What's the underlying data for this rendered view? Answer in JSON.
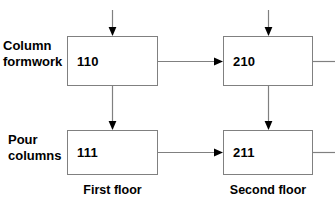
{
  "diagram": {
    "line_color": "#808080",
    "arrow_color": "#000000",
    "text_color": "#000000",
    "background": "#ffffff"
  },
  "row_labels": [
    {
      "line1": "Column",
      "line2": "formwork"
    },
    {
      "line1": "Pour",
      "line2": "columns"
    }
  ],
  "column_labels": [
    {
      "text": "First floor"
    },
    {
      "text": "Second floor"
    }
  ],
  "nodes": [
    {
      "id": "110",
      "label": "110"
    },
    {
      "id": "210",
      "label": "210"
    },
    {
      "id": "111",
      "label": "111"
    },
    {
      "id": "211",
      "label": "211"
    }
  ],
  "connections": [
    {
      "from": "input-top-left",
      "to": "110",
      "kind": "arrow-down"
    },
    {
      "from": "input-top-right",
      "to": "210",
      "kind": "arrow-down"
    },
    {
      "from": "110",
      "to": "210",
      "kind": "arrow-right"
    },
    {
      "from": "110",
      "to": "111",
      "kind": "arrow-down"
    },
    {
      "from": "210",
      "to": "211",
      "kind": "arrow-down"
    },
    {
      "from": "111",
      "to": "211",
      "kind": "arrow-right"
    },
    {
      "from": "210",
      "to": "output-right-top",
      "kind": "line-right"
    },
    {
      "from": "211",
      "to": "output-right-bottom",
      "kind": "line-right"
    }
  ]
}
